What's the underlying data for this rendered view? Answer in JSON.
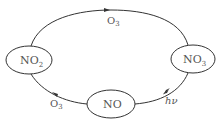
{
  "diagram": {
    "type": "cycle",
    "nodes": [
      {
        "id": "no2",
        "label": "NO",
        "subscript": "2"
      },
      {
        "id": "no3",
        "label": "NO",
        "subscript": "3"
      },
      {
        "id": "no",
        "label": "NO",
        "subscript": ""
      }
    ],
    "edges": [
      {
        "from": "no2",
        "to": "no3",
        "label": "O",
        "subscript": "3"
      },
      {
        "from": "no3",
        "to": "no",
        "label": "hν",
        "subscript": ""
      },
      {
        "from": "no",
        "to": "no2",
        "label": "O",
        "subscript": "3"
      }
    ],
    "colors": {
      "stroke": "#333333",
      "text": "#555555",
      "background": "#ffffff"
    }
  }
}
